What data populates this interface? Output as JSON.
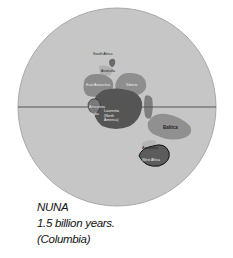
{
  "map": {
    "globe_color": "#c4c4c4",
    "equator_color": "#555555",
    "landmasses": [
      {
        "name": "South Africa",
        "label": "South Africa"
      },
      {
        "name": "Australia",
        "label": "Australia"
      },
      {
        "name": "East Antarctica",
        "label": "East Antarctica"
      },
      {
        "name": "Siberia",
        "label": "Siberia"
      },
      {
        "name": "Laurentia",
        "label": "Laurentia (North America)",
        "lines": [
          "Laurentia",
          "(North",
          "America)"
        ]
      },
      {
        "name": "Amazonia",
        "label": "Amazonia"
      },
      {
        "name": "India",
        "label": "India"
      },
      {
        "name": "Greenland",
        "label": "Greenland"
      },
      {
        "name": "Baltica",
        "label": "Baltica"
      },
      {
        "name": "Amazonia-2",
        "label": "Amazonia"
      },
      {
        "name": "West Africa",
        "label": "West Africa"
      }
    ]
  },
  "caption": {
    "line1": "NUNA",
    "line2": "1.5 billion years.",
    "line3": "(Columbia)"
  }
}
